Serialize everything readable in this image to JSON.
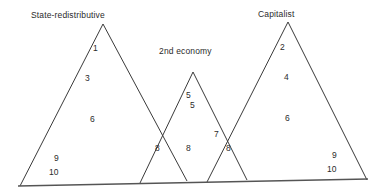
{
  "diagram": {
    "type": "venn-overlapping-triangles",
    "background_color": "#ffffff",
    "line_color": "#3a3a3a",
    "text_color": "#2b2b2b",
    "labels": [
      {
        "id": "left",
        "text": "State-redistributive",
        "x": 31,
        "y": 10
      },
      {
        "id": "middle",
        "text": "2nd economy",
        "x": 159,
        "y": 46
      },
      {
        "id": "right",
        "text": "Capitalist",
        "x": 258,
        "y": 9
      }
    ],
    "region_numbers": [
      {
        "id": "n1",
        "text": "1",
        "x": 93,
        "y": 43,
        "region": "left-upper"
      },
      {
        "id": "n3",
        "text": "3",
        "x": 85,
        "y": 73,
        "region": "left-mid"
      },
      {
        "id": "n6L",
        "text": "6",
        "x": 90,
        "y": 114,
        "region": "left-lower"
      },
      {
        "id": "n9L",
        "text": "9",
        "x": 54,
        "y": 153,
        "region": "left-base"
      },
      {
        "id": "n10L",
        "text": "10",
        "x": 49,
        "y": 167,
        "region": "left-base"
      },
      {
        "id": "n8L",
        "text": "8",
        "x": 155,
        "y": 143,
        "region": "left-middle-overlap"
      },
      {
        "id": "n5a",
        "text": "5",
        "x": 186,
        "y": 90,
        "region": "middle-upper"
      },
      {
        "id": "n5b",
        "text": "5",
        "x": 190,
        "y": 100,
        "region": "middle-upper"
      },
      {
        "id": "n8M",
        "text": "8",
        "x": 186,
        "y": 143,
        "region": "middle-center"
      },
      {
        "id": "n7",
        "text": "7",
        "x": 214,
        "y": 129,
        "region": "middle-right-overlap"
      },
      {
        "id": "n8R",
        "text": "8",
        "x": 226,
        "y": 143,
        "region": "middle-right-overlap"
      },
      {
        "id": "n2",
        "text": "2",
        "x": 280,
        "y": 42,
        "region": "right-upper"
      },
      {
        "id": "n4",
        "text": "4",
        "x": 284,
        "y": 72,
        "region": "right-mid"
      },
      {
        "id": "n6R",
        "text": "6",
        "x": 285,
        "y": 113,
        "region": "right-lower"
      },
      {
        "id": "n9R",
        "text": "9",
        "x": 332,
        "y": 150,
        "region": "right-base"
      },
      {
        "id": "n10R",
        "text": "10",
        "x": 327,
        "y": 164,
        "region": "right-base"
      }
    ],
    "shapes": {
      "triangle_left": "M 20,186 L 103,24 L 187,181",
      "triangle_middle": "M 140,183 L 193,72 L 247,180",
      "triangle_right": "M 207,182 L 288,22 L 367,180",
      "baseline": "M 18,186 L 368,179"
    }
  }
}
